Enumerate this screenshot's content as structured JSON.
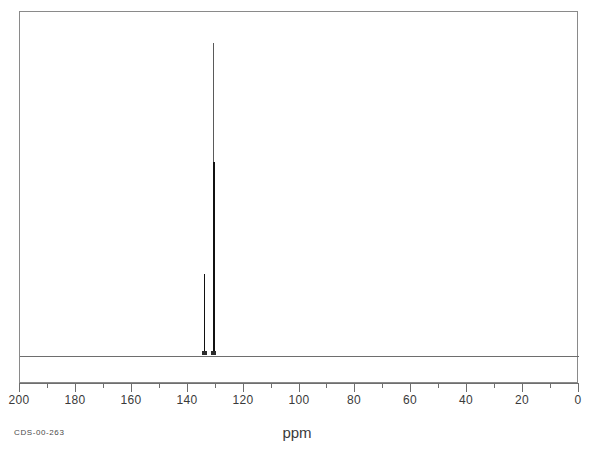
{
  "sample": {
    "id_label": "CDS-00-263"
  },
  "chart_data": {
    "type": "line",
    "title": "",
    "subtitle": "",
    "xlabel": "ppm",
    "ylabel": "",
    "technique": "13C NMR spectrum",
    "xlim": [
      200,
      0
    ],
    "x_axis_reversed": true,
    "ylim": [
      0,
      100
    ],
    "grid": false,
    "legend": null,
    "tick_labels": [
      "200",
      "180",
      "160",
      "140",
      "120",
      "100",
      "80",
      "60",
      "40",
      "20",
      "0"
    ],
    "tick_values": [
      200,
      180,
      160,
      140,
      120,
      100,
      80,
      60,
      40,
      20,
      0
    ],
    "minor_tick_values": [
      190,
      170,
      150,
      130,
      110,
      90,
      70,
      50,
      30,
      10
    ],
    "baseline_y": 0,
    "peaks": [
      {
        "ppm": 134.0,
        "intensity": 26,
        "label": ""
      },
      {
        "ppm": 130.8,
        "intensity": 100,
        "label": ""
      }
    ],
    "annotations": [
      {
        "text": "CDS-00-263",
        "position": "bottom-left"
      },
      {
        "text": "ppm",
        "position": "bottom-center"
      }
    ]
  },
  "axis": {
    "units_label": "ppm"
  },
  "colors": {
    "background": "#ffffff",
    "frame": "#8a8a8a",
    "baseline": "#6e6e6e",
    "trace": "#111111",
    "tick": "#6e6e6e",
    "tick_label": "#3a3a3a"
  }
}
